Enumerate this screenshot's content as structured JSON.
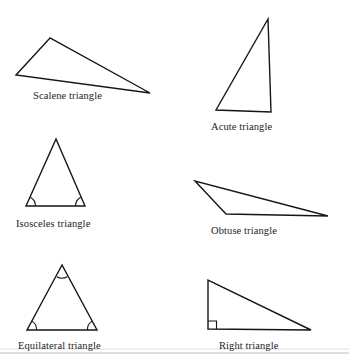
{
  "figure": {
    "background_color": "#ffffff",
    "stroke_color": "#161616",
    "divider_color": "#b9bcc2",
    "width": 349,
    "height": 363
  },
  "triangles": [
    {
      "id": "scalene",
      "label": "Scalene triangle",
      "points": "50,38 16,75 150,93",
      "vertices": [
        [
          50,
          38
        ],
        [
          16,
          75
        ],
        [
          150,
          93
        ]
      ],
      "marks": "none",
      "label_x": 33,
      "label_y": 90
    },
    {
      "id": "acute",
      "label": "Acute triangle",
      "points": "268,19 216,110 271,112",
      "vertices": [
        [
          268,
          19
        ],
        [
          216,
          110
        ],
        [
          271,
          112
        ]
      ],
      "marks": "none",
      "label_x": 211,
      "label_y": 121
    },
    {
      "id": "isosceles",
      "label": "Isosceles triangle",
      "points": "56,139 26,206 85,206",
      "vertices": [
        [
          56,
          139
        ],
        [
          26,
          206
        ],
        [
          85,
          206
        ]
      ],
      "marks": "two-base-angle-arcs",
      "label_x": 16,
      "label_y": 218
    },
    {
      "id": "obtuse",
      "label": "Obtuse triangle",
      "points": "195,181 226,214 328,216",
      "vertices": [
        [
          195,
          181
        ],
        [
          226,
          214
        ],
        [
          328,
          216
        ]
      ],
      "marks": "none",
      "label_x": 211,
      "label_y": 225
    },
    {
      "id": "equilateral",
      "label": "Equilateral triangle",
      "points": "62,265 27,330 97,330",
      "vertices": [
        [
          62,
          265
        ],
        [
          27,
          330
        ],
        [
          97,
          330
        ]
      ],
      "marks": "three-angle-arcs",
      "label_x": 18,
      "label_y": 340
    },
    {
      "id": "right",
      "label": "Right triangle",
      "points": "208,280 208,329 311,330",
      "vertices": [
        [
          208,
          280
        ],
        [
          208,
          329
        ],
        [
          311,
          330
        ]
      ],
      "marks": "right-angle-square",
      "label_x": 219,
      "label_y": 340
    }
  ]
}
